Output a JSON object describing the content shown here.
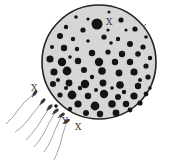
{
  "diagram": {
    "type": "fertilization-illustration",
    "egg": {
      "cx": 99,
      "cy": 62,
      "r": 57,
      "fill": "#d6d6d6",
      "stroke": "#222222",
      "granule_color": "#141414",
      "granules": [
        [
          97,
          24,
          5.5
        ],
        [
          121,
          20,
          2.6
        ],
        [
          76,
          17,
          1.8
        ],
        [
          109,
          12,
          1.5
        ],
        [
          135,
          29,
          2.6
        ],
        [
          66,
          27,
          2.2
        ],
        [
          83,
          30,
          2.6
        ],
        [
          60,
          36,
          3
        ],
        [
          73,
          39,
          2.2
        ],
        [
          88,
          41,
          1.8
        ],
        [
          104,
          37,
          2.6
        ],
        [
          118,
          39,
          2.2
        ],
        [
          130,
          44,
          3
        ],
        [
          143,
          47,
          2.6
        ],
        [
          52,
          47,
          2
        ],
        [
          64,
          48,
          3.2
        ],
        [
          77,
          49,
          2.2
        ],
        [
          92,
          53,
          3.2
        ],
        [
          108,
          52,
          2.6
        ],
        [
          122,
          54,
          3.2
        ],
        [
          138,
          54,
          2.8
        ],
        [
          150,
          58,
          2.2
        ],
        [
          50,
          59,
          3.6
        ],
        [
          62,
          62,
          4.2
        ],
        [
          78,
          61,
          3.2
        ],
        [
          99,
          62,
          4.2
        ],
        [
          115,
          62,
          3.2
        ],
        [
          130,
          62,
          3.2
        ],
        [
          146,
          66,
          2.6
        ],
        [
          54,
          72,
          3.6
        ],
        [
          67,
          71,
          4.4
        ],
        [
          84,
          70,
          3
        ],
        [
          102,
          71,
          3.8
        ],
        [
          119,
          73,
          3.4
        ],
        [
          134,
          72,
          3.6
        ],
        [
          148,
          77,
          2.6
        ],
        [
          53,
          84,
          3
        ],
        [
          69,
          83,
          3.4
        ],
        [
          85,
          84,
          4.2
        ],
        [
          103,
          83,
          3.4
        ],
        [
          120,
          85,
          3.8
        ],
        [
          138,
          86,
          3.2
        ],
        [
          60,
          95,
          2.6
        ],
        [
          72,
          95,
          4.4
        ],
        [
          88,
          96,
          3.2
        ],
        [
          104,
          94,
          4.2
        ],
        [
          118,
          97,
          3
        ],
        [
          134,
          96,
          3.6
        ],
        [
          146,
          94,
          2.4
        ],
        [
          78,
          104,
          3.6
        ],
        [
          95,
          106,
          4.4
        ],
        [
          112,
          104,
          3.8
        ],
        [
          126,
          104,
          3.2
        ],
        [
          140,
          103,
          2.6
        ],
        [
          86,
          113,
          3
        ],
        [
          100,
          114,
          3.2
        ],
        [
          116,
          113,
          3.4
        ],
        [
          130,
          110,
          2.4
        ],
        [
          70,
          109,
          2.2
        ],
        [
          58,
          80,
          2
        ],
        [
          92,
          77,
          2.2
        ],
        [
          111,
          43,
          1.8
        ],
        [
          126,
          30,
          1.6
        ],
        [
          146,
          37,
          1.8
        ],
        [
          140,
          80,
          2
        ],
        [
          124,
          92,
          2.2
        ],
        [
          80,
          88,
          2.2
        ],
        [
          96,
          90,
          2
        ],
        [
          66,
          88,
          2
        ],
        [
          56,
          106,
          1.8
        ],
        [
          150,
          88,
          1.8
        ],
        [
          108,
          30,
          1.6
        ],
        [
          88,
          19,
          1.6
        ],
        [
          70,
          57,
          1.8
        ],
        [
          112,
          88,
          1.8
        ]
      ]
    },
    "sperm": [
      {
        "head": [
          35,
          93
        ],
        "angle": 35,
        "tail": "M35,93 Q24,101 18,110 Q13,118 6,124"
      },
      {
        "head": [
          43,
          101
        ],
        "angle": 40,
        "tail": "M43,101 Q34,112 28,120 Q22,128 15,132"
      },
      {
        "head": [
          50,
          107
        ],
        "angle": 45,
        "tail": "M50,107 Q42,119 37,127 Q31,135 26,140"
      },
      {
        "head": [
          56,
          111
        ],
        "angle": 50,
        "tail": "M56,111 Q48,124 44,133 Q39,142 34,147"
      },
      {
        "head": [
          62,
          115
        ],
        "angle": 55,
        "tail": "M62,115 Q55,129 52,138 Q48,147 44,152"
      },
      {
        "head": [
          67,
          121
        ],
        "angle": 60,
        "tail": "M67,121 Q62,135 60,145 Q57,154 54,160"
      }
    ],
    "labels": [
      {
        "text": "X",
        "x": 106,
        "y": 25,
        "target": "egg-nucleus"
      },
      {
        "text": "X",
        "x": 31,
        "y": 91,
        "target": "sperm-1"
      },
      {
        "text": "Y",
        "x": 62,
        "y": 124,
        "target": "sperm-6"
      },
      {
        "text": "X",
        "x": 75,
        "y": 130,
        "target": "sperm-6"
      }
    ],
    "marker_tick": {
      "x1": 143,
      "y1": 27,
      "x2": 146,
      "y2": 24
    }
  }
}
